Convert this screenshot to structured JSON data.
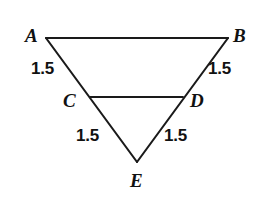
{
  "figure": {
    "background_color": "#ffffff",
    "stroke_color": "#1a1a1a",
    "text_color": "#111111",
    "width": 262,
    "height": 206,
    "vertices": [
      {
        "id": "A",
        "label": "A",
        "x": 46,
        "y": 38
      },
      {
        "id": "B",
        "label": "B",
        "x": 228,
        "y": 38
      },
      {
        "id": "C",
        "label": "C",
        "x": 90,
        "y": 97
      },
      {
        "id": "D",
        "label": "D",
        "x": 183,
        "y": 97
      },
      {
        "id": "E",
        "label": "E",
        "x": 137,
        "y": 162
      }
    ],
    "segments": [
      {
        "id": "AB",
        "from": "A",
        "to": "B",
        "role": "base"
      },
      {
        "id": "AE",
        "from": "A",
        "to": "E",
        "role": "side"
      },
      {
        "id": "BE",
        "from": "B",
        "to": "E",
        "role": "side"
      },
      {
        "id": "CD",
        "from": "C",
        "to": "D",
        "role": "midsegment"
      }
    ],
    "measurements": [
      {
        "id": "AC",
        "segment": "A-C",
        "value": "1.5",
        "position": "left-upper"
      },
      {
        "id": "BD",
        "segment": "B-D",
        "value": "1.5",
        "position": "right-upper"
      },
      {
        "id": "CE",
        "segment": "C-E",
        "value": "1.5",
        "position": "left-lower"
      },
      {
        "id": "DE",
        "segment": "D-E",
        "value": "1.5",
        "position": "right-lower"
      }
    ]
  }
}
